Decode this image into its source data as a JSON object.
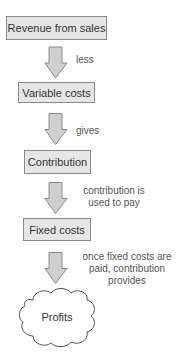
{
  "diagram": {
    "nodes": [
      {
        "id": "revenue",
        "label": "Revenue from sales",
        "shape": "box"
      },
      {
        "id": "variable_costs",
        "label": "Variable costs",
        "shape": "box"
      },
      {
        "id": "contribution",
        "label": "Contribution",
        "shape": "box"
      },
      {
        "id": "fixed_costs",
        "label": "Fixed costs",
        "shape": "box"
      },
      {
        "id": "profits",
        "label": "Profits",
        "shape": "cloud"
      }
    ],
    "edges": [
      {
        "from": "revenue",
        "to": "variable_costs",
        "label_lines": [
          "less"
        ]
      },
      {
        "from": "variable_costs",
        "to": "contribution",
        "label_lines": [
          "gives"
        ]
      },
      {
        "from": "contribution",
        "to": "fixed_costs",
        "label_lines": [
          "contribution is",
          "used to pay"
        ]
      },
      {
        "from": "fixed_costs",
        "to": "profits",
        "label_lines": [
          "once fixed costs are",
          "paid, contribution",
          "provides"
        ]
      }
    ],
    "colors": {
      "box_fill": "#e6e6e6",
      "box_border": "#8a8a8a",
      "arrow_fill": "#cfcfcf",
      "arrow_stroke": "#8a8a8a"
    }
  }
}
